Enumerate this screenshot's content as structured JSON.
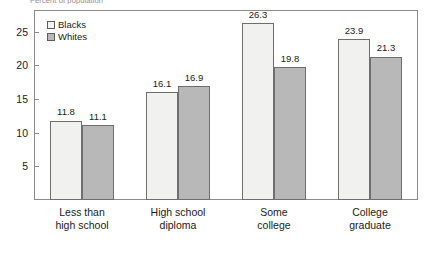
{
  "supertitle": "Percent of population",
  "legend": {
    "position": "top-left",
    "entries": [
      {
        "label": "Blacks",
        "swatch": "blacks",
        "color": "#f1f1ef"
      },
      {
        "label": "Whites",
        "swatch": "whites",
        "color": "#b8b8b8"
      }
    ]
  },
  "axis": {
    "y_ticks": [
      "5",
      "10",
      "15",
      "20",
      "25"
    ]
  },
  "chart_data": {
    "type": "bar",
    "title": "Percent of population",
    "xlabel": "",
    "ylabel": "",
    "ylim": [
      0,
      28.2
    ],
    "grid": false,
    "legend_position": "top-left",
    "categories": [
      "Less than high school",
      "High school diploma",
      "Some college",
      "College graduate"
    ],
    "category_lines": [
      [
        "Less than",
        "high school"
      ],
      [
        "High school",
        "diploma"
      ],
      [
        "Some",
        "college"
      ],
      [
        "College",
        "graduate"
      ]
    ],
    "yticks": [
      5,
      10,
      15,
      20,
      25
    ],
    "series": [
      {
        "name": "Blacks",
        "color": "#f1f1ef",
        "values": [
          11.8,
          16.1,
          26.3,
          23.9
        ],
        "labels": [
          "11.8",
          "16.1",
          "26.3",
          "23.9"
        ]
      },
      {
        "name": "Whites",
        "color": "#b8b8b8",
        "values": [
          11.1,
          16.9,
          19.8,
          21.3
        ],
        "labels": [
          "11.1",
          "16.9",
          "19.8",
          "21.3"
        ]
      }
    ]
  }
}
